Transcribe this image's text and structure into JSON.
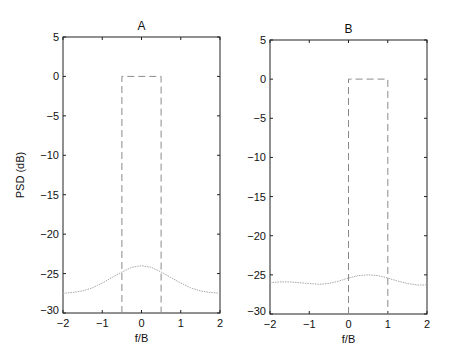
{
  "chart_data": [
    {
      "type": "line",
      "title": "A",
      "xlabel": "f/B",
      "ylabel": "PSD (dB)",
      "xlim": [
        -2,
        2
      ],
      "ylim": [
        -30,
        5
      ],
      "xticks": [
        -2,
        -1,
        0,
        1,
        2
      ],
      "yticks": [
        5,
        0,
        -5,
        -10,
        -15,
        -20,
        -25,
        -30
      ],
      "grid": false,
      "series": [
        {
          "name": "mask",
          "style": "dashed",
          "x": [
            -0.5,
            -0.5,
            0.5,
            0.5
          ],
          "y": [
            -30,
            0,
            0,
            -30
          ]
        },
        {
          "name": "psd",
          "style": "dotted",
          "x": [
            -2,
            -1.75,
            -1.5,
            -1.25,
            -1,
            -0.75,
            -0.5,
            -0.25,
            0,
            0.25,
            0.5,
            0.75,
            1,
            1.25,
            1.5,
            1.75,
            2
          ],
          "y": [
            -27.5,
            -27.4,
            -27.2,
            -26.8,
            -26.2,
            -25.5,
            -24.8,
            -24.2,
            -24.0,
            -24.2,
            -24.8,
            -25.5,
            -26.2,
            -26.8,
            -27.2,
            -27.4,
            -27.5
          ]
        }
      ]
    },
    {
      "type": "line",
      "title": "B",
      "xlabel": "f/B",
      "ylabel": "",
      "xlim": [
        -2,
        2
      ],
      "ylim": [
        -30,
        5
      ],
      "xticks": [
        -2,
        -1,
        0,
        1,
        2
      ],
      "yticks": [
        5,
        0,
        -5,
        -10,
        -15,
        -20,
        -25,
        -30
      ],
      "grid": false,
      "series": [
        {
          "name": "mask",
          "style": "dashed",
          "x": [
            0,
            0,
            1,
            1
          ],
          "y": [
            -30,
            0,
            0,
            -30
          ]
        },
        {
          "name": "psd",
          "style": "dotted",
          "x": [
            -2,
            -1.75,
            -1.5,
            -1.25,
            -1,
            -0.75,
            -0.5,
            -0.25,
            0,
            0.25,
            0.5,
            0.75,
            1,
            1.25,
            1.5,
            1.75,
            2
          ],
          "y": [
            -26.0,
            -25.9,
            -25.9,
            -26.0,
            -26.1,
            -26.2,
            -26.1,
            -25.8,
            -25.4,
            -25.1,
            -25.0,
            -25.1,
            -25.4,
            -25.8,
            -26.1,
            -26.3,
            -26.3
          ]
        }
      ]
    }
  ]
}
